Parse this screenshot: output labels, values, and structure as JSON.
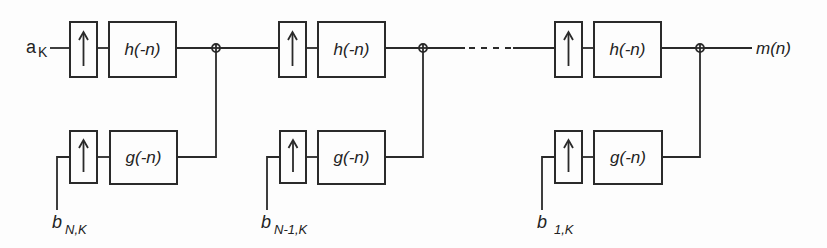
{
  "diagram": {
    "type": "block-diagram",
    "input_top": {
      "main": "a",
      "sub": "K"
    },
    "output": {
      "label": "m(n)"
    },
    "stages": [
      {
        "upper": {
          "upsampler_symbol": "↑",
          "filter": "h(-n)"
        },
        "lower": {
          "upsampler_symbol": "↑",
          "filter": "g(-n)"
        },
        "lower_input": {
          "main": "b",
          "sub": "N,K"
        },
        "adder": "⊕"
      },
      {
        "upper": {
          "upsampler_symbol": "↑",
          "filter": "h(-n)"
        },
        "lower": {
          "upsampler_symbol": "↑",
          "filter": "g(-n)"
        },
        "lower_input": {
          "main": "b",
          "sub": "N-1,K"
        },
        "adder": "⊕"
      },
      {
        "upper": {
          "upsampler_symbol": "↑",
          "filter": "h(-n)"
        },
        "lower": {
          "upsampler_symbol": "↑",
          "filter": "g(-n)"
        },
        "lower_input": {
          "main": "b",
          "sub": "1,K"
        },
        "adder": "⊕"
      }
    ],
    "ellipsis": "- - - -",
    "colors": {
      "ink": "#2a2a2a",
      "background": "#fdfdfd"
    }
  }
}
